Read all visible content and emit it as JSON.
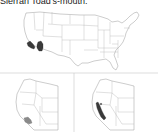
{
  "caption": "Sierran Toad's-mouth.",
  "maps": [
    {
      "id": "us-overview",
      "label": "",
      "highlighted_regions": [
        "southern California",
        "western Arizona"
      ],
      "highlight_color": "#3a3a3a"
    },
    {
      "id": "west-inset-left",
      "label": "",
      "highlighted_regions": [
        "southern California"
      ],
      "highlight_color": "#8a8a8a"
    },
    {
      "id": "west-inset-right",
      "label": "",
      "highlighted_regions": [
        "Sierra Nevada, California"
      ],
      "highlight_color": "#3a3a3a"
    }
  ],
  "colors": {
    "dark": "#3a3a3a",
    "gray": "#8a8a8a",
    "outline": "#9a9a9a",
    "divider": "#c8c8c8"
  }
}
